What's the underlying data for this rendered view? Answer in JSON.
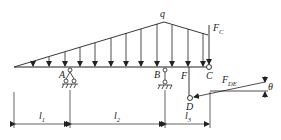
{
  "diagram": {
    "type": "beam-mechanics",
    "load": {
      "label": "q",
      "shape": "trapezoidal distributed load"
    },
    "points": {
      "A": "A",
      "B": "B",
      "C": "C",
      "D": "D",
      "F": "F"
    },
    "forces": {
      "fc": {
        "main": "F",
        "sub": "C"
      },
      "fde": {
        "main": "F",
        "sub": "DE"
      }
    },
    "angle": "θ",
    "dimensions": [
      {
        "main": "l",
        "sub": "1"
      },
      {
        "main": "l",
        "sub": "2"
      },
      {
        "main": "l",
        "sub": "3"
      }
    ]
  }
}
